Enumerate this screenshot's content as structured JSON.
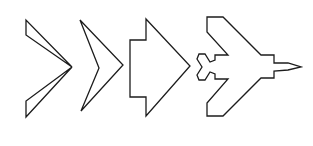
{
  "figure": {
    "stroke_color": "#1c1c1c",
    "background": "#ffffff",
    "shapes": [
      {
        "name": "split-delta",
        "polygons": [
          "26,20 26,35 72,67",
          "72,67 26,101 26,117"
        ]
      },
      {
        "name": "chevron",
        "polygons": [
          "80,20 123,65 81,111 99,68"
        ]
      },
      {
        "name": "arrow-delta",
        "polygons": [
          "146,19 190,66 146,116 146,97 130,97 130,40 146,40"
        ]
      },
      {
        "name": "aircraft-silhouette",
        "polygons": [
          "207,17 223,17 261,55 274,55 274,63 288,63 301,67 288,70 274,71 274,78 261,78 223,116 207,116 207,103 228,79 215,79 215,74 210,72 205,80 199,80 197,75 202,67 197,59 199,54 205,54 210,62 215,60 215,55 228,55 207,32"
        ]
      }
    ]
  }
}
